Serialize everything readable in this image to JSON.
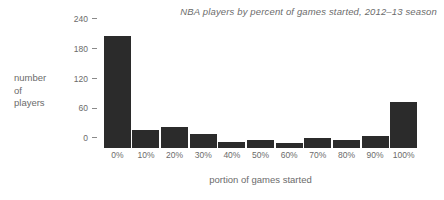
{
  "chart_data": {
    "type": "bar",
    "title": "NBA players by percent of games started, 2012–13 season",
    "xlabel": "portion of games started",
    "ylabel": "number of players",
    "ylabel_lines": [
      "number",
      "of",
      "players"
    ],
    "categories": [
      "0%",
      "10%",
      "20%",
      "30%",
      "40%",
      "50%",
      "60%",
      "70%",
      "80%",
      "90%",
      "100%"
    ],
    "values": [
      225,
      36,
      42,
      28,
      12,
      16,
      10,
      20,
      16,
      24,
      93
    ],
    "ylim": [
      0,
      240
    ],
    "y_ticks": [
      0,
      60,
      120,
      180,
      240
    ],
    "y_tick_labels": [
      "0",
      "60",
      "120",
      "180",
      "240"
    ],
    "grid": false,
    "legend": null,
    "bar_color": "#2b2b2b",
    "text_color": "#6b6b6b",
    "background_color": "#ffffff"
  }
}
